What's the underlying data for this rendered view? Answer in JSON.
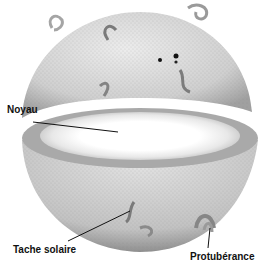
{
  "diagram": {
    "labels": {
      "core": "Noyau",
      "sunspot": "Tache solaire",
      "prominence": "Protubérance"
    },
    "colors": {
      "surface": "#c9c9c9",
      "surface_dark": "#8e8e8e",
      "core": "#ffffff",
      "ring": "#a9a9a9",
      "leader_line": "#111111"
    }
  }
}
